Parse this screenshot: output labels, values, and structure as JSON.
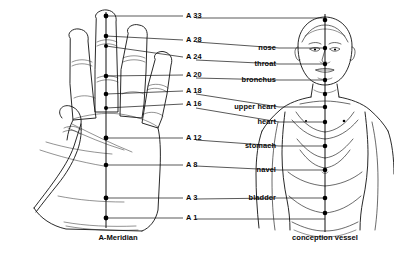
{
  "figure": {
    "background_color": "#ffffff",
    "ink_color": "#111111",
    "width": 394,
    "height": 263
  },
  "left_panel": {
    "caption": "A-Meridian",
    "subject": "right hand, palm view",
    "meridian_axis_x": 106,
    "points": [
      {
        "id": "A33",
        "label": "A 33",
        "y": 16,
        "point_x": 106,
        "point_y": 16,
        "label_x": 186
      },
      {
        "id": "A28",
        "label": "A 28",
        "y": 40,
        "point_x": 106,
        "point_y": 36,
        "label_x": 186
      },
      {
        "id": "A24",
        "label": "A 24",
        "y": 57,
        "point_x": 106,
        "point_y": 46,
        "label_x": 186
      },
      {
        "id": "A20",
        "label": "A 20",
        "y": 75,
        "point_x": 106,
        "point_y": 76,
        "label_x": 186
      },
      {
        "id": "A18",
        "label": "A 18",
        "y": 91,
        "point_x": 106,
        "point_y": 94,
        "label_x": 186
      },
      {
        "id": "A16",
        "label": "A 16",
        "y": 104,
        "point_x": 106,
        "point_y": 108,
        "label_x": 186
      },
      {
        "id": "A12",
        "label": "A 12",
        "y": 138,
        "point_x": 106,
        "point_y": 138,
        "label_x": 186
      },
      {
        "id": "A8",
        "label": "A 8",
        "y": 165,
        "point_x": 106,
        "point_y": 165,
        "label_x": 186
      },
      {
        "id": "A3",
        "label": "A 3",
        "y": 198,
        "point_x": 106,
        "point_y": 198,
        "label_x": 186
      },
      {
        "id": "A1",
        "label": "A 1",
        "y": 218,
        "point_x": 106,
        "point_y": 218,
        "label_x": 186
      }
    ]
  },
  "right_panel": {
    "caption": "conception vessel",
    "subject": "human figure, anterior view, head and torso",
    "meridian_axis_x": 325,
    "points": [
      {
        "id": "nose",
        "label": "nose",
        "y": 48,
        "point_x": 325,
        "point_y": 48,
        "label_x": 276
      },
      {
        "id": "throat",
        "label": "throat",
        "y": 64,
        "point_x": 325,
        "point_y": 64,
        "label_x": 276
      },
      {
        "id": "bronchus",
        "label": "bronchus",
        "y": 80,
        "point_x": 325,
        "point_y": 80,
        "label_x": 276
      },
      {
        "id": "upper-heart",
        "label": "upper heart",
        "y": 107,
        "point_x": 325,
        "point_y": 107,
        "label_x": 276
      },
      {
        "id": "heart",
        "label": "heart",
        "y": 122,
        "point_x": 325,
        "point_y": 122,
        "label_x": 276
      },
      {
        "id": "stomach",
        "label": "stomach",
        "y": 146,
        "point_x": 325,
        "point_y": 146,
        "label_x": 276
      },
      {
        "id": "navel",
        "label": "navel",
        "y": 170,
        "point_x": 325,
        "point_y": 170,
        "label_x": 276
      },
      {
        "id": "bladder",
        "label": "bladder",
        "y": 198,
        "point_x": 325,
        "point_y": 198,
        "label_x": 276
      }
    ],
    "extra_points": [
      {
        "id": "crown",
        "point_x": 325,
        "point_y": 20
      },
      {
        "id": "sternum",
        "point_x": 325,
        "point_y": 94
      },
      {
        "id": "pubis",
        "point_x": 325,
        "point_y": 213
      }
    ]
  },
  "captions": {
    "left": {
      "text": "A-Meridian",
      "x": 118,
      "y": 237
    },
    "right": {
      "text": "conception vessel",
      "x": 325,
      "y": 237
    }
  }
}
